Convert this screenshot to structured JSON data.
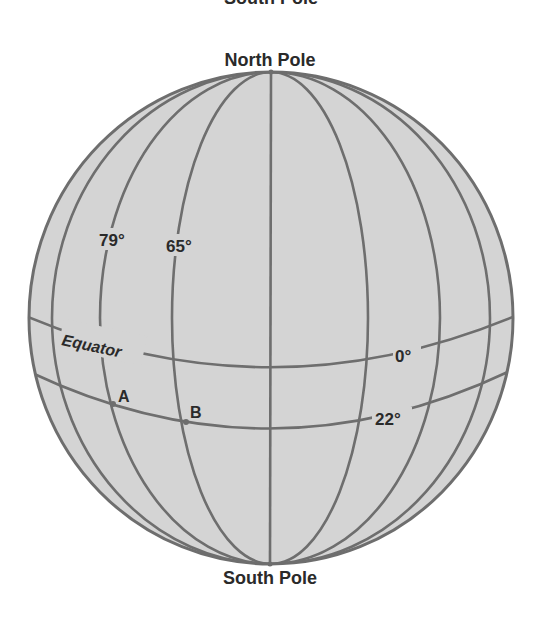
{
  "diagram": {
    "type": "globe-latitude-longitude",
    "colors": {
      "globe_fill": "#d4d4d4",
      "grid_line": "#6e6e6e",
      "label_text": "#2a2a2a",
      "point": "#6e6e6e"
    },
    "labels": {
      "top_clipped": "South Pole",
      "north_pole": "North Pole",
      "south_pole": "South Pole",
      "equator": "Equator"
    },
    "meridian_labels": [
      {
        "text": "79°",
        "name": "meridian-79"
      },
      {
        "text": "65°",
        "name": "meridian-65"
      }
    ],
    "parallel_labels": [
      {
        "text": "0°",
        "name": "parallel-0"
      },
      {
        "text": "22°",
        "name": "parallel-22"
      }
    ],
    "points": [
      {
        "label": "A",
        "longitude": "79°",
        "latitude": "22°"
      },
      {
        "label": "B",
        "longitude": "65°",
        "latitude": "22°"
      }
    ]
  }
}
